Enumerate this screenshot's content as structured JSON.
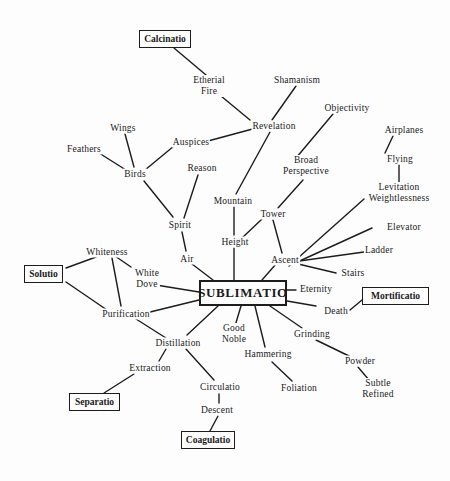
{
  "diagram": {
    "title": "SUBLIMATIO",
    "boxes": [
      {
        "id": "sublimatio",
        "label": "SUBLIMATIO",
        "x": 199,
        "y": 280,
        "w": 88,
        "h": 26,
        "center": true
      },
      {
        "id": "calcinatio",
        "label": "Calcinatio",
        "x": 139,
        "y": 30,
        "w": 52,
        "h": 18
      },
      {
        "id": "solutio",
        "label": "Solutio",
        "x": 24,
        "y": 265,
        "w": 39,
        "h": 18
      },
      {
        "id": "mortificatio",
        "label": "Mortificatio",
        "x": 362,
        "y": 287,
        "w": 67,
        "h": 18
      },
      {
        "id": "separatio",
        "label": "Separatio",
        "x": 69,
        "y": 393,
        "w": 51,
        "h": 18
      },
      {
        "id": "coagulatio",
        "label": "Coagulatio",
        "x": 181,
        "y": 431,
        "w": 54,
        "h": 18
      }
    ],
    "nodes": [
      {
        "id": "etherial_fire",
        "label": "Etherial\nFire",
        "x": 209,
        "y": 86
      },
      {
        "id": "shamanism",
        "label": "Shamanism",
        "x": 297,
        "y": 80
      },
      {
        "id": "revelation",
        "label": "Revelation",
        "x": 274,
        "y": 126
      },
      {
        "id": "objectivity",
        "label": "Objectivity",
        "x": 347,
        "y": 108
      },
      {
        "id": "wings",
        "label": "Wings",
        "x": 123,
        "y": 128
      },
      {
        "id": "auspices",
        "label": "Auspices",
        "x": 191,
        "y": 142
      },
      {
        "id": "feathers",
        "label": "Feathers",
        "x": 84,
        "y": 149
      },
      {
        "id": "birds",
        "label": "Birds",
        "x": 135,
        "y": 174
      },
      {
        "id": "reason",
        "label": "Reason",
        "x": 202,
        "y": 168
      },
      {
        "id": "broad_perspective",
        "label": "Broad\nPerspective",
        "x": 306,
        "y": 166
      },
      {
        "id": "airplanes",
        "label": "Airplanes",
        "x": 404,
        "y": 130
      },
      {
        "id": "flying",
        "label": "Flying",
        "x": 400,
        "y": 159
      },
      {
        "id": "levitation",
        "label": "Levitation\nWeightlessness",
        "x": 399,
        "y": 193
      },
      {
        "id": "mountain",
        "label": "Mountain",
        "x": 233,
        "y": 201
      },
      {
        "id": "spirit",
        "label": "Spirit",
        "x": 180,
        "y": 225
      },
      {
        "id": "tower",
        "label": "Tower",
        "x": 273,
        "y": 214
      },
      {
        "id": "height",
        "label": "Height",
        "x": 235,
        "y": 242
      },
      {
        "id": "elevator",
        "label": "Elevator",
        "x": 404,
        "y": 227
      },
      {
        "id": "ladder",
        "label": "Ladder",
        "x": 379,
        "y": 250
      },
      {
        "id": "air",
        "label": "Air",
        "x": 187,
        "y": 259
      },
      {
        "id": "ascent",
        "label": "Ascent",
        "x": 285,
        "y": 260
      },
      {
        "id": "stairs",
        "label": "Stairs",
        "x": 353,
        "y": 273
      },
      {
        "id": "whiteness",
        "label": "Whiteness",
        "x": 107,
        "y": 252
      },
      {
        "id": "white_dove",
        "label": "White\nDove",
        "x": 147,
        "y": 279
      },
      {
        "id": "eternity",
        "label": "Eternity",
        "x": 316,
        "y": 289
      },
      {
        "id": "death",
        "label": "Death",
        "x": 336,
        "y": 311
      },
      {
        "id": "purification",
        "label": "Purification",
        "x": 126,
        "y": 314
      },
      {
        "id": "good_noble",
        "label": "Good\nNoble",
        "x": 234,
        "y": 334
      },
      {
        "id": "grinding",
        "label": "Grinding",
        "x": 312,
        "y": 334
      },
      {
        "id": "distillation",
        "label": "Distillation",
        "x": 178,
        "y": 343
      },
      {
        "id": "hammering",
        "label": "Hammering",
        "x": 268,
        "y": 354
      },
      {
        "id": "powder",
        "label": "Powder",
        "x": 360,
        "y": 361
      },
      {
        "id": "extraction",
        "label": "Extraction",
        "x": 150,
        "y": 368
      },
      {
        "id": "circulatio",
        "label": "Circulatio",
        "x": 220,
        "y": 387
      },
      {
        "id": "foliation",
        "label": "Foliation",
        "x": 299,
        "y": 388
      },
      {
        "id": "subtle_refined",
        "label": "Subtle\nRefined",
        "x": 378,
        "y": 389
      },
      {
        "id": "descent",
        "label": "Descent",
        "x": 217,
        "y": 410
      }
    ],
    "edges": [
      [
        174,
        48,
        206,
        75
      ],
      [
        221,
        96,
        250,
        120
      ],
      [
        296,
        86,
        272,
        120
      ],
      [
        260,
        127,
        208,
        141
      ],
      [
        333,
        114,
        296,
        158
      ],
      [
        393,
        136,
        385,
        153
      ],
      [
        399,
        165,
        399,
        182
      ],
      [
        125,
        134,
        134,
        167
      ],
      [
        99,
        153,
        126,
        170
      ],
      [
        174,
        146,
        145,
        170
      ],
      [
        144,
        181,
        173,
        217
      ],
      [
        198,
        175,
        184,
        218
      ],
      [
        270,
        132,
        236,
        194
      ],
      [
        303,
        180,
        278,
        208
      ],
      [
        234,
        207,
        234,
        235
      ],
      [
        262,
        219,
        242,
        238
      ],
      [
        273,
        220,
        282,
        253
      ],
      [
        182,
        232,
        186,
        251
      ],
      [
        234,
        248,
        234,
        280
      ],
      [
        192,
        264,
        213,
        280
      ],
      [
        289,
        266,
        364,
        199
      ],
      [
        293,
        264,
        372,
        228
      ],
      [
        292,
        262,
        364,
        252
      ],
      [
        294,
        263,
        336,
        273
      ],
      [
        276,
        264,
        262,
        280
      ],
      [
        66,
        268,
        96,
        257
      ],
      [
        115,
        256,
        131,
        267
      ],
      [
        112,
        258,
        121,
        306
      ],
      [
        66,
        282,
        107,
        310
      ],
      [
        156,
        285,
        199,
        292
      ],
      [
        146,
        313,
        199,
        300
      ],
      [
        287,
        290,
        296,
        290
      ],
      [
        287,
        301,
        316,
        306
      ],
      [
        350,
        310,
        362,
        300
      ],
      [
        136,
        319,
        166,
        338
      ],
      [
        218,
        306,
        187,
        335
      ],
      [
        241,
        306,
        235,
        326
      ],
      [
        255,
        306,
        265,
        347
      ],
      [
        270,
        306,
        302,
        328
      ],
      [
        316,
        340,
        349,
        356
      ],
      [
        272,
        362,
        292,
        381
      ],
      [
        358,
        367,
        369,
        380
      ],
      [
        166,
        349,
        159,
        361
      ],
      [
        186,
        349,
        214,
        380
      ],
      [
        134,
        374,
        104,
        393
      ],
      [
        219,
        394,
        219,
        403
      ],
      [
        218,
        416,
        210,
        431
      ]
    ]
  }
}
